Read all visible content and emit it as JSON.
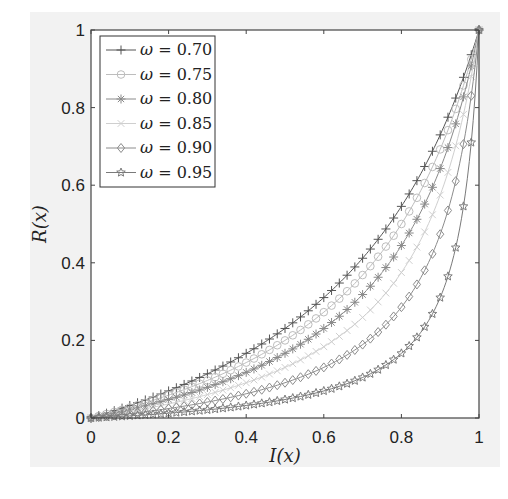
{
  "chart_data": {
    "type": "line",
    "title": "",
    "xlabel": "I(x)",
    "ylabel": "R(x)",
    "xlim": [
      0,
      1
    ],
    "ylim": [
      0,
      1
    ],
    "grid": false,
    "legend_position": "upper left",
    "xticks": [
      "0",
      "0.2",
      "0.4",
      "0.6",
      "0.8",
      "1"
    ],
    "yticks": [
      "0",
      "0.2",
      "0.4",
      "0.6",
      "0.8",
      "1"
    ],
    "formula_estimate": "R = (1 - omega) * x / (1 - omega * x)",
    "x": [
      0,
      0.1,
      0.2,
      0.3,
      0.4,
      0.5,
      0.6,
      0.7,
      0.8,
      0.9,
      1.0
    ],
    "series": [
      {
        "name": "ω = 0.70",
        "omega": 0.7,
        "marker": "plus",
        "color": "#555555",
        "values": [
          0,
          0.032,
          0.07,
          0.114,
          0.167,
          0.231,
          0.31,
          0.412,
          0.545,
          0.73,
          1.0
        ]
      },
      {
        "name": "ω = 0.75",
        "omega": 0.75,
        "marker": "circle",
        "color": "#bdbdbd",
        "values": [
          0,
          0.027,
          0.059,
          0.097,
          0.143,
          0.2,
          0.273,
          0.368,
          0.5,
          0.692,
          1.0
        ]
      },
      {
        "name": "ω = 0.80",
        "omega": 0.8,
        "marker": "asterisk",
        "color": "#8a8a8a",
        "values": [
          0,
          0.022,
          0.048,
          0.079,
          0.118,
          0.167,
          0.231,
          0.318,
          0.444,
          0.643,
          1.0
        ]
      },
      {
        "name": "ω = 0.85",
        "omega": 0.85,
        "marker": "cross",
        "color": "#cfcfcf",
        "values": [
          0,
          0.016,
          0.036,
          0.06,
          0.091,
          0.13,
          0.184,
          0.259,
          0.375,
          0.574,
          1.0
        ]
      },
      {
        "name": "ω = 0.90",
        "omega": 0.9,
        "marker": "diamond",
        "color": "#8c8c8c",
        "values": [
          0,
          0.011,
          0.024,
          0.041,
          0.063,
          0.091,
          0.13,
          0.189,
          0.286,
          0.474,
          1.0
        ]
      },
      {
        "name": "ω = 0.95",
        "omega": 0.95,
        "marker": "star",
        "color": "#7a7a7a",
        "values": [
          0,
          0.006,
          0.012,
          0.021,
          0.032,
          0.048,
          0.07,
          0.104,
          0.167,
          0.31,
          1.0
        ]
      }
    ]
  },
  "legend": {
    "items": [
      {
        "symbol": "ω",
        "eq": "= 0.70"
      },
      {
        "symbol": "ω",
        "eq": "= 0.75"
      },
      {
        "symbol": "ω",
        "eq": "= 0.80"
      },
      {
        "symbol": "ω",
        "eq": "= 0.85"
      },
      {
        "symbol": "ω",
        "eq": "= 0.90"
      },
      {
        "symbol": "ω",
        "eq": "= 0.95"
      }
    ]
  },
  "axes": {
    "xlabel": "I(x)",
    "ylabel": "R(x)"
  }
}
